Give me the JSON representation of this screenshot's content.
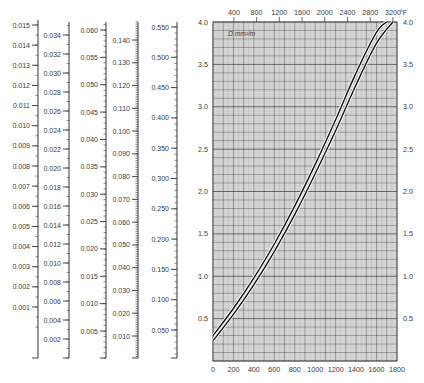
{
  "chart_data": [
    {
      "type": "scale",
      "name": "scale-1",
      "min": 0.0,
      "max": 0.015,
      "labels": [
        "0.015",
        "0.014",
        "0.013",
        "0.012",
        "0.011",
        "0.010",
        "0.009",
        "0.008",
        "0.007",
        "0.006",
        "0.005",
        "0.004",
        "0.003",
        "0.002",
        "0.001"
      ],
      "label_values": [
        0.015,
        0.014,
        0.013,
        0.012,
        0.011,
        0.01,
        0.009,
        0.008,
        0.007,
        0.006,
        0.005,
        0.004,
        0.003,
        0.002,
        0.001
      ],
      "minor_per_major": 2,
      "tick_side": "right"
    },
    {
      "type": "scale",
      "name": "scale-2",
      "min": 0.0,
      "max": 0.036,
      "labels": [
        "0.034",
        "0.032",
        "0.030",
        "0.028",
        "0.026",
        "0.024",
        "0.022",
        "0.020",
        "0.018",
        "0.016",
        "0.014",
        "0.012",
        "0.010",
        "0.008",
        "0.006",
        "0.004",
        "0.002"
      ],
      "label_values": [
        0.034,
        0.032,
        0.03,
        0.028,
        0.026,
        0.024,
        0.022,
        0.02,
        0.018,
        0.016,
        0.014,
        0.012,
        0.01,
        0.008,
        0.006,
        0.004,
        0.002
      ],
      "minor_per_major": 2,
      "tick_side": "right"
    },
    {
      "type": "scale",
      "name": "scale-3",
      "min": 0.0,
      "max": 0.062,
      "labels": [
        "0.060",
        "0.055",
        "0.050",
        "0.045",
        "0.040",
        "0.035",
        "0.030",
        "0.025",
        "0.020",
        "0.015",
        "0.010",
        "0.005"
      ],
      "label_values": [
        0.06,
        0.055,
        0.05,
        0.045,
        0.04,
        0.035,
        0.03,
        0.025,
        0.02,
        0.015,
        0.01,
        0.005
      ],
      "minor_per_major": 5,
      "tick_side": "right"
    },
    {
      "type": "scale",
      "name": "scale-4",
      "min": 0.0,
      "max": 0.148,
      "labels": [
        "0.140",
        "0.130",
        "0.120",
        "0.110",
        "0.100",
        "0.090",
        "0.080",
        "0.070",
        "0.060",
        "0.050",
        "0.040",
        "0.030",
        "0.020",
        "0.010"
      ],
      "label_values": [
        0.14,
        0.13,
        0.12,
        0.11,
        0.1,
        0.09,
        0.08,
        0.07,
        0.06,
        0.05,
        0.04,
        0.03,
        0.02,
        0.01
      ],
      "minor_per_major": 10,
      "tick_side": "right"
    },
    {
      "type": "scale",
      "name": "scale-5",
      "min": 0.0,
      "max": 0.57,
      "labels": [
        "0.550",
        "0.500",
        "0.450",
        "0.400",
        "0.350",
        "0.300",
        "0.250",
        "0.200",
        "0.150",
        "0.100",
        "0.050"
      ],
      "label_values": [
        0.55,
        0.5,
        0.45,
        0.4,
        0.35,
        0.3,
        0.25,
        0.2,
        0.15,
        0.1,
        0.05
      ],
      "minor_per_major": 5,
      "tick_side": "right"
    },
    {
      "type": "line",
      "title": "",
      "annotation": "Ω mm²/m",
      "xlabel": "°C",
      "xlabel_top": "°F",
      "ylabel": "Ω mm²/m",
      "xlim": [
        0,
        1800
      ],
      "ylim": [
        0,
        4.0
      ],
      "x_ticks": [
        0,
        200,
        400,
        600,
        800,
        1000,
        1200,
        1400,
        1600,
        1800
      ],
      "x_tick_labels": [
        "0",
        "200",
        "400",
        "600",
        "800",
        "1000",
        "1200",
        "1400",
        "1600",
        "1800"
      ],
      "x_top_ticks_f": [
        400,
        800,
        1200,
        1600,
        2000,
        2400,
        2800,
        3200
      ],
      "x_top_tick_labels": [
        "400",
        "800",
        "1200",
        "1600",
        "2000",
        "2400",
        "2800",
        "3200"
      ],
      "x_top_unit": "°F",
      "y_ticks": [
        0.5,
        1.0,
        1.5,
        2.0,
        2.5,
        3.0,
        3.5,
        4.0
      ],
      "y_tick_labels": [
        "0.5",
        "1.0",
        "1.5",
        "2.0",
        "2.5",
        "3.0",
        "3.5",
        "4.0"
      ],
      "grid": true,
      "series": [
        {
          "name": "upper curve",
          "x": [
            0,
            200,
            400,
            600,
            800,
            1000,
            1200,
            1400,
            1600,
            1700
          ],
          "values": [
            0.3,
            0.62,
            0.98,
            1.38,
            1.83,
            2.32,
            2.85,
            3.4,
            3.88,
            4.0
          ]
        },
        {
          "name": "lower curve",
          "x": [
            0,
            200,
            400,
            600,
            800,
            1000,
            1200,
            1400,
            1600,
            1760
          ],
          "values": [
            0.24,
            0.55,
            0.9,
            1.29,
            1.73,
            2.21,
            2.72,
            3.26,
            3.75,
            4.0
          ]
        }
      ]
    }
  ]
}
